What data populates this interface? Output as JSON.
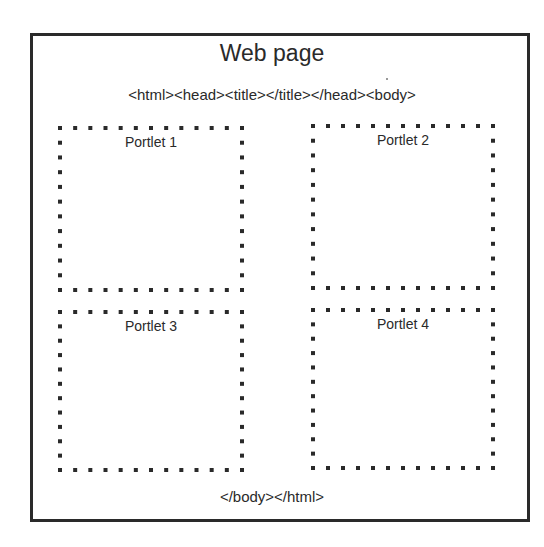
{
  "diagram": {
    "title": "Web page",
    "open_markup": "<html><head><title></title></head><body>",
    "close_markup": "</body></html>",
    "border_color": "#2a2a2a",
    "portlets": [
      {
        "label": "Portlet 1",
        "x": 58,
        "y": 126,
        "w": 186,
        "h": 166
      },
      {
        "label": "Portlet 2",
        "x": 311,
        "y": 124,
        "w": 184,
        "h": 166
      },
      {
        "label": "Portlet 3",
        "x": 58,
        "y": 310,
        "w": 186,
        "h": 162
      },
      {
        "label": "Portlet 4",
        "x": 311,
        "y": 308,
        "w": 184,
        "h": 162
      }
    ]
  }
}
